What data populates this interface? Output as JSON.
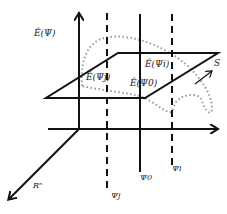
{
  "diagram": {
    "labels": {
      "y_axis": "Ê(Ψ)",
      "diag_axis": "Rⁿ",
      "surface": "S",
      "point_j": "Ê(Ψj)",
      "point_i": "Ê(Ψi)",
      "point_0": "Ê(Ψ0)",
      "psi_j": "Ψj",
      "psi_0": "Ψ0",
      "psi_i": "Ψi"
    },
    "colors": {
      "line": "#111111",
      "dotted": "#999999"
    }
  }
}
